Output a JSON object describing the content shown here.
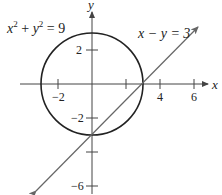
{
  "diagram": {
    "type": "coordinate-plane-graph",
    "colors": {
      "axis": "#444444",
      "circle": "#222222",
      "line": "#666666",
      "background": "#ffffff"
    },
    "axes": {
      "x_label": "x",
      "y_label": "y",
      "x_ticks": [
        {
          "value": -2,
          "label": "−2"
        },
        {
          "value": 2,
          "label": ""
        },
        {
          "value": 4,
          "label": "4"
        },
        {
          "value": 6,
          "label": "6"
        }
      ],
      "y_ticks": [
        {
          "value": 2,
          "label": "2"
        },
        {
          "value": -2,
          "label": "−2"
        },
        {
          "value": -4,
          "label": ""
        },
        {
          "value": -6,
          "label": "−6"
        }
      ]
    },
    "curves": [
      {
        "name": "circle",
        "equation_parts": {
          "x": "x",
          "x_exp": "2",
          "plus": " + ",
          "y": "y",
          "y_exp": "2",
          "rhs": " = 9"
        },
        "center": [
          0,
          0
        ],
        "radius": 3
      },
      {
        "name": "line",
        "equation": "x − y = 3",
        "slope": 1,
        "intercept": -3
      }
    ],
    "intersection_points": [
      [
        3,
        0
      ],
      [
        0,
        -3
      ]
    ]
  }
}
